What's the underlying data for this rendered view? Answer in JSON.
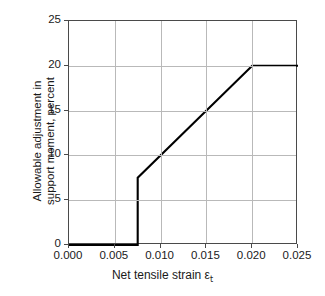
{
  "chart_data": {
    "type": "line",
    "title": "",
    "xlabel": "Net tensile strain ε",
    "xlabel_sub": "t",
    "ylabel_line1": "Allowable adjustment in",
    "ylabel_line2": "support moment, percent",
    "xlim": [
      0.0,
      0.025
    ],
    "ylim": [
      0,
      25
    ],
    "xticks": [
      "0.000",
      "0.005",
      "0.010",
      "0.015",
      "0.020",
      "0.025"
    ],
    "xtick_values": [
      0.0,
      0.005,
      0.01,
      0.015,
      0.02,
      0.025
    ],
    "yticks": [
      "0",
      "5",
      "10",
      "15",
      "20",
      "25"
    ],
    "ytick_values": [
      0,
      5,
      10,
      15,
      20,
      25
    ],
    "grid": true,
    "legend": "none",
    "line_color": "#000000",
    "grid_color": "#b9b9b9",
    "frame_color": "#4a4a4a",
    "series": [
      {
        "name": "Allowable redistribution",
        "x": [
          0.0,
          0.0075,
          0.0075,
          0.02,
          0.025
        ],
        "y": [
          0,
          0,
          7.5,
          20,
          20
        ]
      }
    ],
    "annotations": []
  }
}
